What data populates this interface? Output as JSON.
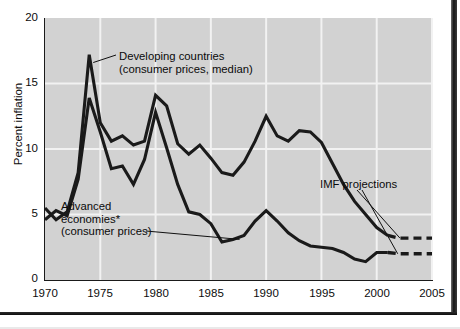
{
  "chart_data": {
    "type": "line",
    "title": "",
    "xlabel": "",
    "ylabel": "Percent inflation",
    "xlim": [
      1970,
      2005
    ],
    "ylim": [
      0,
      20
    ],
    "yticks": [
      0,
      5,
      10,
      15,
      20
    ],
    "xticks": [
      1970,
      1975,
      1980,
      1985,
      1990,
      1995,
      2000,
      2005
    ],
    "grid": "both",
    "legend": "annotations",
    "annotations": [
      {
        "key": "developing",
        "text": "Developing countries\n(consumer prices, median)"
      },
      {
        "key": "advanced",
        "text": "Advanced\neconomies*\n(consumer prices)"
      },
      {
        "key": "projections",
        "text": "IMF projections"
      }
    ],
    "series": [
      {
        "name": "Developing countries (consumer prices, median)",
        "color": "#1a1a1a",
        "x": [
          1970,
          1971,
          1972,
          1973,
          1974,
          1975,
          1976,
          1977,
          1978,
          1979,
          1980,
          1981,
          1982,
          1983,
          1984,
          1985,
          1986,
          1987,
          1988,
          1989,
          1990,
          1991,
          1992,
          1993,
          1994,
          1995,
          1996,
          1997,
          1998,
          1999,
          2000,
          2001
        ],
        "values": [
          5.5,
          4.6,
          5.2,
          8.2,
          17.2,
          12.0,
          10.6,
          11.0,
          10.3,
          10.6,
          14.1,
          13.3,
          10.4,
          9.6,
          10.3,
          9.3,
          8.2,
          8.0,
          9.0,
          10.6,
          12.5,
          11.0,
          10.6,
          11.4,
          11.3,
          10.5,
          8.9,
          7.3,
          6.0,
          5.0,
          4.0,
          3.4
        ],
        "projection_x": [
          2001,
          2002,
          2003,
          2004,
          2005
        ],
        "projection_values": [
          3.4,
          3.2,
          3.2,
          3.2,
          3.2
        ],
        "projection_style": "dashed"
      },
      {
        "name": "Advanced economies* (consumer prices)",
        "color": "#1a1a1a",
        "x": [
          1970,
          1971,
          1972,
          1973,
          1974,
          1975,
          1976,
          1977,
          1978,
          1979,
          1980,
          1981,
          1982,
          1983,
          1984,
          1985,
          1986,
          1987,
          1988,
          1989,
          1990,
          1991,
          1992,
          1993,
          1994,
          1995,
          1996,
          1997,
          1998,
          1999,
          2000,
          2001
        ],
        "values": [
          4.6,
          5.3,
          4.9,
          7.7,
          13.9,
          11.3,
          8.5,
          8.7,
          7.3,
          9.2,
          12.8,
          10.1,
          7.3,
          5.2,
          5.0,
          4.3,
          2.9,
          3.1,
          3.4,
          4.5,
          5.3,
          4.5,
          3.6,
          3.0,
          2.6,
          2.5,
          2.4,
          2.1,
          1.6,
          1.4,
          2.1,
          2.1
        ],
        "projection_x": [
          2001,
          2002,
          2003,
          2004,
          2005
        ],
        "projection_values": [
          2.1,
          2.0,
          2.0,
          2.0,
          2.0
        ],
        "projection_style": "dashed"
      }
    ],
    "colors": {
      "plot_background": "#d2d2d2",
      "gridline": "#f2f2f2",
      "line": "#1a1a1a",
      "text": "#0c0c0c",
      "page_background": "#ffffff"
    }
  },
  "axes": {
    "y_title": "Percent inflation",
    "y_tick_labels": [
      "20",
      "15",
      "10",
      "5",
      "0"
    ],
    "x_tick_labels": [
      "1970",
      "1975",
      "1980",
      "1985",
      "1990",
      "1995",
      "2000",
      "2005"
    ]
  },
  "labels": {
    "developing": "Developing countries\n(consumer prices, median)",
    "advanced": "Advanced\neconomies*\n(consumer prices)",
    "imf": "IMF projections"
  }
}
